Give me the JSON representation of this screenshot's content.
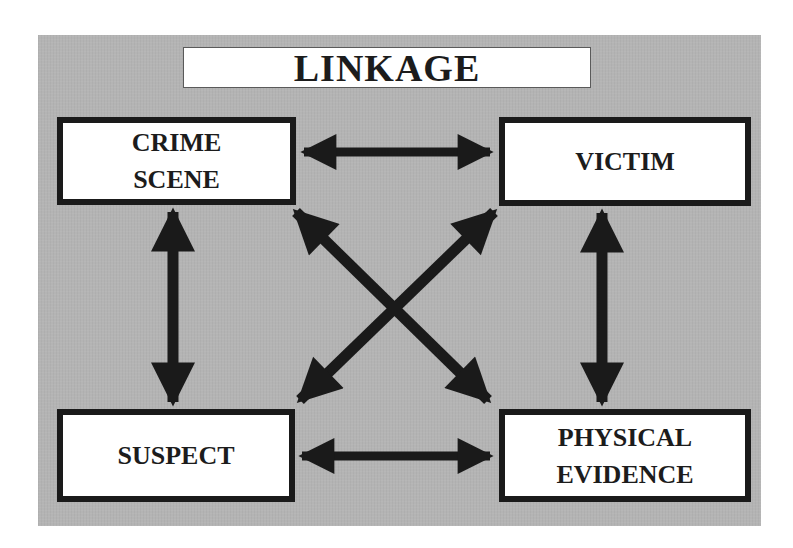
{
  "diagram": {
    "title": "LINKAGE",
    "nodes": {
      "crime_scene": {
        "line1": "CRIME",
        "line2": "SCENE"
      },
      "victim": {
        "line1": "VICTIM"
      },
      "suspect": {
        "line1": "SUSPECT"
      },
      "physical_evidence": {
        "line1": "PHYSICAL",
        "line2": "EVIDENCE"
      }
    },
    "edges": [
      {
        "from": "CRIME SCENE",
        "to": "VICTIM",
        "type": "bidirectional"
      },
      {
        "from": "CRIME SCENE",
        "to": "SUSPECT",
        "type": "bidirectional"
      },
      {
        "from": "CRIME SCENE",
        "to": "PHYSICAL EVIDENCE",
        "type": "bidirectional"
      },
      {
        "from": "VICTIM",
        "to": "SUSPECT",
        "type": "bidirectional"
      },
      {
        "from": "VICTIM",
        "to": "PHYSICAL EVIDENCE",
        "type": "bidirectional"
      },
      {
        "from": "SUSPECT",
        "to": "PHYSICAL EVIDENCE",
        "type": "bidirectional"
      }
    ],
    "colors": {
      "background_panel": "#b4b4b4",
      "box_fill": "#ffffff",
      "box_border": "#1a1a1a",
      "arrow": "#1a1a1a",
      "text": "#1c1c1c"
    }
  }
}
